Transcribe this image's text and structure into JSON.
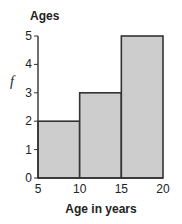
{
  "chart_data": {
    "type": "bar",
    "subtype": "histogram",
    "title": "Ages",
    "xlabel": "Age in years",
    "ylabel": "f",
    "bins": [
      [
        5,
        10
      ],
      [
        10,
        15
      ],
      [
        15,
        20
      ]
    ],
    "categories": [
      "5-10",
      "10-15",
      "15-20"
    ],
    "values": [
      2,
      3,
      5
    ],
    "xticks": [
      5,
      10,
      15,
      20
    ],
    "yticks": [
      0,
      1,
      2,
      3,
      4,
      5
    ],
    "xlim": [
      5,
      20
    ],
    "ylim": [
      0,
      5
    ],
    "grid": false,
    "legend": null,
    "bar_color": "#cdcdcd",
    "edge_color": "#333333"
  }
}
